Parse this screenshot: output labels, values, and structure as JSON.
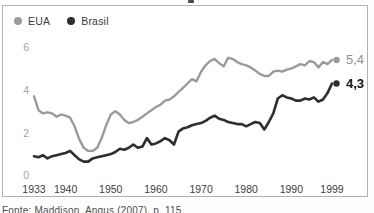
{
  "frame": {
    "border_color": "#b2b2b2"
  },
  "caption": "Fonte: Maddison, Angus (2007), p. 115",
  "chart_data": {
    "type": "line",
    "title": "",
    "xlabel": "",
    "ylabel": "",
    "ylim": [
      0,
      6
    ],
    "yticks": [
      0,
      2,
      4,
      6
    ],
    "xticks": [
      1933,
      1940,
      1950,
      1960,
      1970,
      1980,
      1990,
      1999
    ],
    "grid": false,
    "legend_position": "top-left",
    "y_tick_color": "#a3a3a3",
    "x_tick_color": "#3d3d3d",
    "x": [
      1933,
      1934,
      1935,
      1936,
      1937,
      1938,
      1939,
      1940,
      1941,
      1942,
      1943,
      1944,
      1945,
      1946,
      1947,
      1948,
      1949,
      1950,
      1951,
      1952,
      1953,
      1954,
      1955,
      1956,
      1957,
      1958,
      1959,
      1960,
      1961,
      1962,
      1963,
      1964,
      1965,
      1966,
      1967,
      1968,
      1969,
      1970,
      1971,
      1972,
      1973,
      1974,
      1975,
      1976,
      1977,
      1978,
      1979,
      1980,
      1981,
      1982,
      1983,
      1984,
      1985,
      1986,
      1987,
      1988,
      1989,
      1990,
      1991,
      1992,
      1993,
      1994,
      1995,
      1996,
      1997,
      1998,
      1999
    ],
    "series": [
      {
        "name": "EUA",
        "color": "#9b9b9b",
        "line_width": 2.4,
        "end_label": "5,4",
        "end_label_color": "#8f8f8f",
        "end_label_bold": false,
        "values": [
          3.7,
          3.05,
          2.9,
          2.95,
          2.9,
          2.75,
          2.85,
          2.8,
          2.7,
          2.3,
          1.7,
          1.3,
          1.15,
          1.15,
          1.3,
          1.75,
          2.35,
          2.85,
          3.0,
          2.85,
          2.6,
          2.45,
          2.5,
          2.6,
          2.75,
          2.9,
          3.05,
          3.2,
          3.3,
          3.5,
          3.55,
          3.7,
          3.9,
          4.1,
          4.3,
          4.5,
          4.4,
          4.85,
          5.15,
          5.35,
          5.45,
          5.25,
          5.1,
          5.5,
          5.45,
          5.3,
          5.2,
          5.15,
          5.05,
          4.9,
          4.75,
          4.65,
          4.65,
          4.85,
          4.9,
          4.85,
          4.95,
          5.0,
          5.1,
          5.2,
          5.15,
          5.35,
          5.3,
          5.05,
          5.3,
          5.2,
          5.4
        ]
      },
      {
        "name": "Brasil",
        "color": "#2e2e2e",
        "line_width": 2.6,
        "end_label": "4,3",
        "end_label_color": "#141414",
        "end_label_bold": true,
        "values": [
          0.9,
          0.85,
          0.95,
          0.8,
          0.9,
          0.95,
          1.0,
          1.05,
          1.15,
          0.95,
          0.75,
          0.65,
          0.65,
          0.8,
          0.85,
          0.9,
          0.95,
          1.0,
          1.1,
          1.25,
          1.2,
          1.3,
          1.45,
          1.3,
          1.35,
          1.75,
          1.45,
          1.5,
          1.6,
          1.75,
          1.65,
          1.45,
          2.05,
          2.2,
          2.25,
          2.35,
          2.4,
          2.45,
          2.55,
          2.7,
          2.8,
          2.65,
          2.6,
          2.5,
          2.45,
          2.4,
          2.4,
          2.3,
          2.4,
          2.5,
          2.45,
          2.15,
          2.5,
          2.9,
          3.6,
          3.75,
          3.65,
          3.6,
          3.5,
          3.5,
          3.6,
          3.55,
          3.65,
          3.45,
          3.55,
          3.85,
          4.3
        ]
      }
    ]
  }
}
